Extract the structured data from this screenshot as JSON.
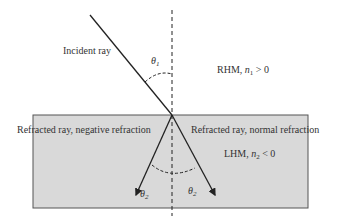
{
  "diagram": {
    "labels": {
      "incident_ray": "Incident ray",
      "theta1": "θ",
      "theta1_sub": "1",
      "rhm": "RHM, ",
      "rhm_cond_var": "n",
      "rhm_cond_sub": "1",
      "rhm_cond": " > 0",
      "refracted_negative": "Refracted ray, negative refraction",
      "refracted_normal": "Refracted ray, normal refraction",
      "lhm": "LHM, ",
      "lhm_cond_var": "n",
      "lhm_cond_sub": "2",
      "lhm_cond": " < 0",
      "theta2_left": "θ",
      "theta2_left_sub": "2",
      "theta2_right": "θ",
      "theta2_right_sub": "2"
    },
    "colors": {
      "medium_fill": "#d9d9d9",
      "line": "#222222",
      "border": "#555555"
    }
  }
}
